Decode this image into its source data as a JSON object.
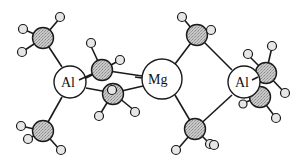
{
  "diagram": {
    "type": "molecular-structure",
    "colors": {
      "carbon": "#bdbdbd",
      "metal": "#ffffff",
      "outline": "#1a1a1a"
    },
    "metals": [
      {
        "id": "al1",
        "label": "Al",
        "x": 70,
        "y": 82,
        "r": 16
      },
      {
        "id": "mg",
        "label": "Mg",
        "x": 162,
        "y": 79,
        "r": 20
      },
      {
        "id": "al2",
        "label": "Al",
        "x": 244,
        "y": 82,
        "r": 16
      }
    ],
    "labels": {
      "al1": "Al",
      "mg": "Mg",
      "al2": "Al"
    }
  }
}
